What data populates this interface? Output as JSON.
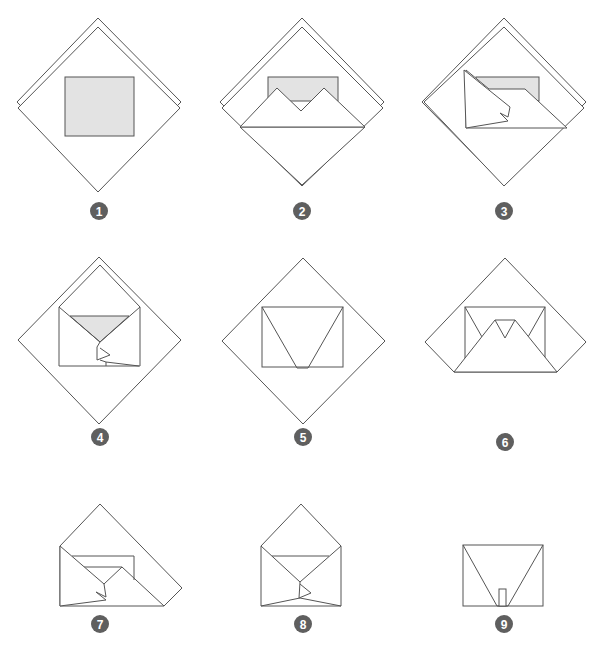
{
  "colors": {
    "line": "#555555",
    "shade": "#e3e3e3",
    "badge": "#5f5f5f",
    "background": "#ffffff"
  },
  "steps": [
    {
      "number": "1",
      "description": "Square sheet placed diagonally with a rectangular card in the center"
    },
    {
      "number": "2",
      "description": "Bottom corner folded up over the card"
    },
    {
      "number": "3",
      "description": "Left corner folded in over the card"
    },
    {
      "number": "4",
      "description": "Right corner folded in, top flap remaining"
    },
    {
      "number": "5",
      "description": "Envelope body formed on diamond"
    },
    {
      "number": "6",
      "description": "Lower flap folded up over envelope body"
    },
    {
      "number": "7",
      "description": "Side folded in"
    },
    {
      "number": "8",
      "description": "Top flap ready to fold down"
    },
    {
      "number": "9",
      "description": "Finished envelope with tab"
    }
  ]
}
